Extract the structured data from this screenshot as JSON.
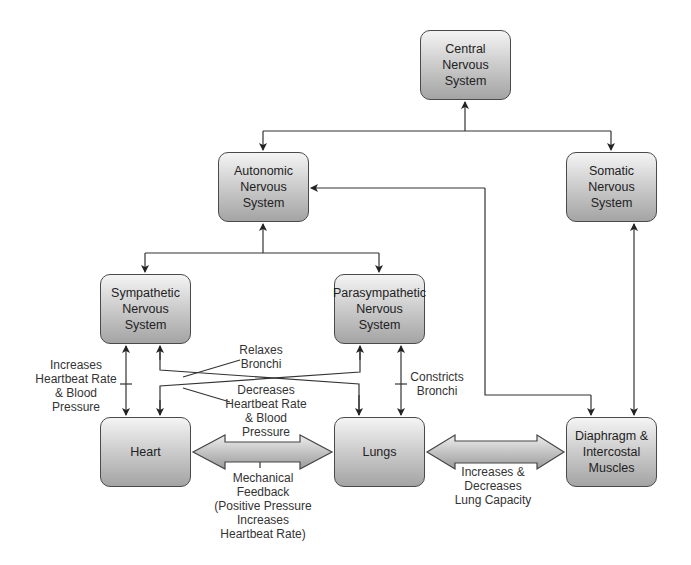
{
  "nodes": {
    "cns": "Central\nNervous\nSystem",
    "ans": "Autonomic\nNervous\nSystem",
    "somatic": "Somatic\nNervous\nSystem",
    "sympathetic": "Sympathetic\nNervous\nSystem",
    "parasympathetic": "Parasympathetic\nNervous\nSystem",
    "heart": "Heart",
    "lungs": "Lungs",
    "diaphragm": "Diaphragm &\nIntercostal\nMuscles"
  },
  "labels": {
    "increases_hr": "Increases\nHeartbeat Rate\n& Blood\nPressure",
    "relaxes_bronchi": "Relaxes\nBronchi",
    "decreases_hr": "Decreases\nHeartbeat Rate\n& Blood\nPressure",
    "constricts_bronchi": "Constricts\nBronchi",
    "mechanical_feedback": "Mechanical\nFeedback\n(Positive Pressure\nIncreases\nHeartbeat Rate)",
    "lung_capacity": "Increases &\nDecreases\nLung Capacity"
  },
  "colors": {
    "line": "#333333",
    "box_border": "#4a4a4a"
  }
}
